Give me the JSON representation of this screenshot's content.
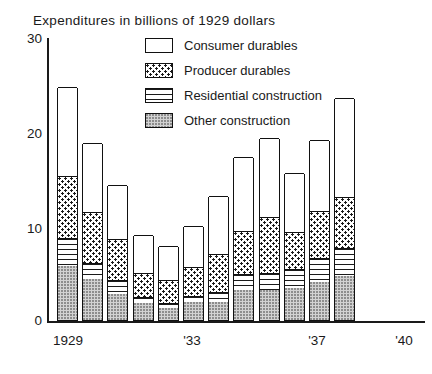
{
  "chart": {
    "title": "Expenditures in billions of 1929 dollars",
    "y_ticks": [
      "30",
      "20",
      "10",
      "0"
    ],
    "x_ticks": [
      "1929",
      "'33",
      "'37",
      "'40"
    ]
  },
  "legend": {
    "items": [
      {
        "label": "Consumer durables",
        "key": "consumer",
        "pattern": "open-white"
      },
      {
        "label": "Producer durables",
        "key": "producer",
        "pattern": "dotted"
      },
      {
        "label": "Residential construction",
        "key": "residential",
        "pattern": "horizontal-lines"
      },
      {
        "label": "Other construction",
        "key": "other",
        "pattern": "stippled-gray"
      }
    ]
  },
  "chart_data": {
    "type": "bar",
    "stacked": true,
    "title": "Expenditures in billions of 1929 dollars",
    "xlabel": "",
    "ylabel": "Expenditures in billions of 1929 dollars",
    "ylim": [
      0,
      30
    ],
    "yticks": [
      0,
      10,
      20,
      30
    ],
    "grid": false,
    "legend_position": "top-center",
    "categories": [
      "1929",
      "1930",
      "1931",
      "1932",
      "1933",
      "1934",
      "1935",
      "1936",
      "1937",
      "1938",
      "1939",
      "1940"
    ],
    "tick_labels": [
      "1929",
      "",
      "",
      "",
      "'33",
      "",
      "",
      "",
      "'37",
      "",
      "",
      "'40"
    ],
    "series": [
      {
        "name": "Other construction",
        "values": [
          5.7,
          4.3,
          2.7,
          1.8,
          1.3,
          1.9,
          1.9,
          3.2,
          3.2,
          3.4,
          4.0,
          4.6
        ]
      },
      {
        "name": "Residential construction",
        "values": [
          2.9,
          1.7,
          1.5,
          0.6,
          0.5,
          0.6,
          1.0,
          1.6,
          1.7,
          2.0,
          2.5,
          3.0
        ]
      },
      {
        "name": "Producer durables",
        "values": [
          6.6,
          5.4,
          4.3,
          2.5,
          2.4,
          3.1,
          4.0,
          4.6,
          5.9,
          3.9,
          5.0,
          5.4
        ]
      },
      {
        "name": "Consumer durables",
        "values": [
          9.3,
          7.2,
          5.7,
          4.0,
          3.6,
          4.3,
          6.2,
          7.8,
          8.4,
          6.2,
          7.4,
          10.4
        ]
      }
    ],
    "totals": [
      24.5,
      18.6,
      14.2,
      8.9,
      7.8,
      9.9,
      13.1,
      17.2,
      19.2,
      15.5,
      18.9,
      23.4
    ]
  }
}
